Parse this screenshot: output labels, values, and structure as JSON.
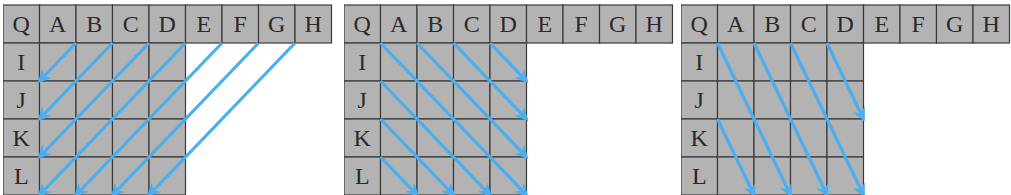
{
  "colors": {
    "cell_fill": "#b3b3b3",
    "grid_line": "#3a3a3a",
    "arrow": "#4aaef0",
    "background": "#ffffff"
  },
  "grid": {
    "corner_label": "Q",
    "column_labels": [
      "A",
      "B",
      "C",
      "D",
      "E",
      "F",
      "G",
      "H"
    ],
    "row_labels": [
      "I",
      "J",
      "K",
      "L"
    ],
    "body_columns": 4
  },
  "panels": [
    {
      "name": "diagonal-down-left",
      "x": 3,
      "arrows": [
        {
          "from": [
            2,
            1
          ],
          "to": [
            1,
            2
          ]
        },
        {
          "from": [
            3,
            1
          ],
          "to": [
            1,
            3
          ]
        },
        {
          "from": [
            4,
            1
          ],
          "to": [
            1,
            4
          ]
        },
        {
          "from": [
            5,
            1
          ],
          "to": [
            1,
            5
          ]
        },
        {
          "from": [
            6,
            1
          ],
          "to": [
            2,
            5
          ]
        },
        {
          "from": [
            7,
            1
          ],
          "to": [
            3,
            5
          ]
        },
        {
          "from": [
            8,
            1
          ],
          "to": [
            4,
            5
          ]
        }
      ]
    },
    {
      "name": "diagonal-down-right",
      "x": 344,
      "arrows": [
        {
          "from": [
            1,
            1
          ],
          "to": [
            5,
            5
          ]
        },
        {
          "from": [
            2,
            1
          ],
          "to": [
            5,
            4
          ]
        },
        {
          "from": [
            3,
            1
          ],
          "to": [
            5,
            3
          ]
        },
        {
          "from": [
            4,
            1
          ],
          "to": [
            5,
            2
          ]
        },
        {
          "from": [
            1,
            2
          ],
          "to": [
            4,
            5
          ]
        },
        {
          "from": [
            1,
            3
          ],
          "to": [
            3,
            5
          ]
        },
        {
          "from": [
            1,
            4
          ],
          "to": [
            2,
            5
          ]
        }
      ]
    },
    {
      "name": "steep-down-right",
      "x": 681,
      "arrows": [
        {
          "from": [
            1,
            1
          ],
          "to": [
            3,
            5
          ]
        },
        {
          "from": [
            2,
            1
          ],
          "to": [
            4,
            5
          ]
        },
        {
          "from": [
            3,
            1
          ],
          "to": [
            5,
            5
          ]
        },
        {
          "from": [
            4,
            1
          ],
          "to": [
            5,
            3
          ]
        },
        {
          "from": [
            1,
            3
          ],
          "to": [
            2,
            5
          ]
        }
      ]
    }
  ]
}
